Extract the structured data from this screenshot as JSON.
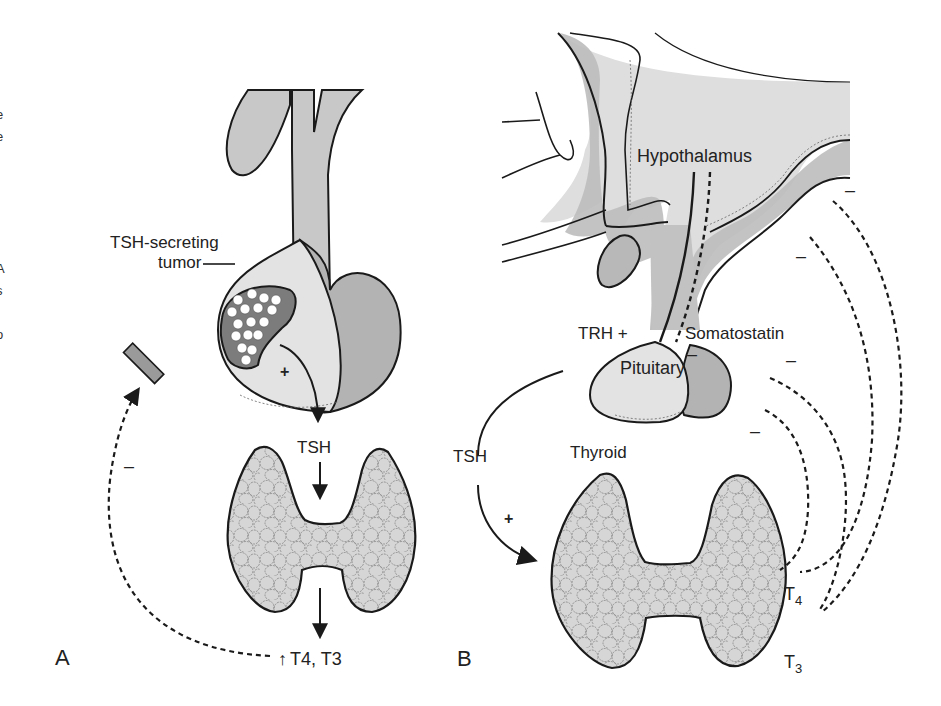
{
  "figure": {
    "panel_a": {
      "panel_label": "A",
      "tumor_label_line1": "TSH-secreting",
      "tumor_label_line2": "tumor",
      "plus_sign": "+",
      "tsh_label": "TSH",
      "minus_sign": "–",
      "output_arrow": "↑",
      "output_label_t4": "T",
      "output_sub_4": "4",
      "output_sep": ", T",
      "output_sub_3": "3"
    },
    "panel_b": {
      "panel_label": "B",
      "hypothalamus_label": "Hypothalamus",
      "trh_label": "TRH +",
      "somatostatin_label": "Somatostatin",
      "somatostatin_minus": "–",
      "pituitary_label": "Pituitary",
      "tsh_label": "TSH",
      "plus_sign": "+",
      "thyroid_label": "Thyroid",
      "t4_label": "T",
      "t4_sub": "4",
      "t3_label": "T",
      "t3_sub": "3",
      "feedback_minus": [
        "–",
        "–",
        "–",
        "–"
      ]
    },
    "edge_text_fragments": [
      ".",
      ".",
      "e",
      "e",
      "l",
      "l",
      ".",
      "f",
      ".",
      "A",
      "s",
      "l",
      "o"
    ]
  },
  "colors": {
    "light_gray": "#dcdcdc",
    "mid_gray": "#b9b9b9",
    "dark_gray": "#8a8a8a",
    "tumor_fill": "#7a7a7a",
    "block_bar": "#9a9a9a",
    "line": "#1a1a1a"
  }
}
